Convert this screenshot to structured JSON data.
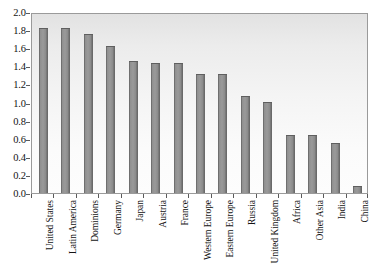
{
  "chart_data": {
    "type": "bar",
    "title": "",
    "subtitle": "",
    "xlabel": "",
    "ylabel": "",
    "ylim": [
      0.0,
      2.0
    ],
    "ytick_step": 0.2,
    "grid": false,
    "legend": false,
    "legend_position": "none",
    "orientation": "vertical",
    "bar_color": "#8f8f8f",
    "bar_edge_color": "#5f5f5f",
    "plot_background": "#f2f2f2",
    "plot_border_color": "#9a9a9a",
    "axis_color": "#5a5a5a",
    "text_color": "#141414",
    "ytick_labels": [
      "0.0",
      "0.2",
      "0.4",
      "0.6",
      "0.8",
      "1.0",
      "1.2",
      "1.4",
      "1.6",
      "1.8",
      "2.0"
    ],
    "ytick_values": [
      0.0,
      0.2,
      0.4,
      0.6,
      0.8,
      1.0,
      1.2,
      1.4,
      1.6,
      1.8,
      2.0
    ],
    "categories": [
      "United States",
      "Latin America",
      "Dominions",
      "Germany",
      "Japan",
      "Austria",
      "France",
      "Western Europe",
      "Eastern Europe",
      "Russia",
      "United Kingdom",
      "Africa",
      "Other Asia",
      "India",
      "China"
    ],
    "values": [
      1.82,
      1.82,
      1.76,
      1.62,
      1.46,
      1.44,
      1.44,
      1.32,
      1.31,
      1.07,
      1.01,
      0.64,
      0.64,
      0.55,
      0.08
    ]
  }
}
